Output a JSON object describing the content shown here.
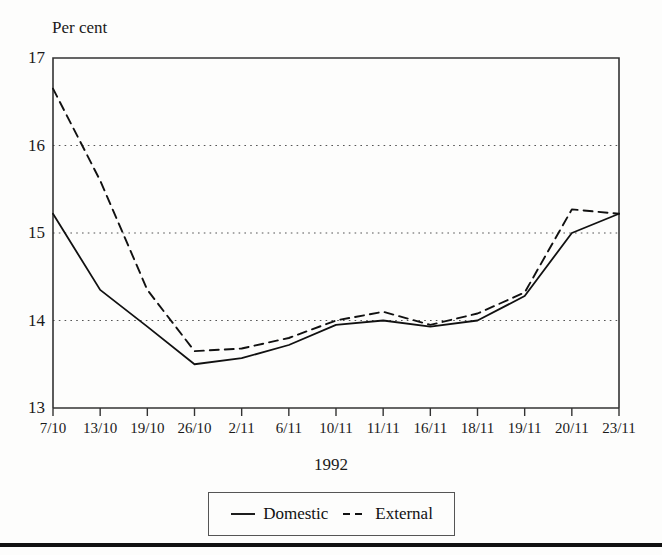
{
  "figure": {
    "y_axis_title": "Per cent",
    "x_axis_title": "1992"
  },
  "legend": {
    "items": [
      {
        "label": "Domestic",
        "style": "solid",
        "swatch": "solid-line-icon"
      },
      {
        "label": "External",
        "style": "dashed",
        "swatch": "dashed-line-icon"
      }
    ]
  },
  "chart_data": {
    "type": "line",
    "title": "",
    "xlabel": "1992",
    "ylabel": "Per cent",
    "ylim": [
      13,
      17
    ],
    "yticks": [
      13,
      14,
      15,
      16,
      17
    ],
    "grid": "horizontal-dotted",
    "legend_position": "bottom-center",
    "categories": [
      "7/10",
      "13/10",
      "19/10",
      "26/10",
      "2/11",
      "6/11",
      "10/11",
      "11/11",
      "16/11",
      "18/11",
      "19/11",
      "20/11",
      "23/11"
    ],
    "series": [
      {
        "name": "Domestic",
        "style": "solid",
        "values": [
          15.22,
          14.35,
          13.93,
          13.5,
          13.57,
          13.72,
          13.95,
          14.0,
          13.93,
          14.0,
          14.28,
          15.0,
          15.22
        ]
      },
      {
        "name": "External",
        "style": "dashed",
        "values": [
          16.65,
          15.6,
          14.35,
          13.65,
          13.68,
          13.8,
          14.0,
          14.1,
          13.95,
          14.08,
          14.32,
          15.27,
          15.22
        ]
      }
    ]
  },
  "colors": {
    "axis": "#333333",
    "series_domestic": "#111111",
    "series_external": "#111111",
    "grid": "#555555",
    "rule": "#111111"
  }
}
